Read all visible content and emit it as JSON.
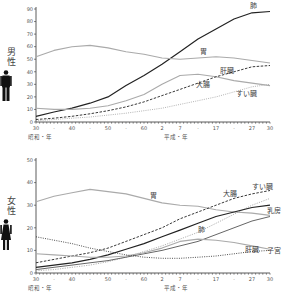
{
  "chart_data": [
    {
      "type": "line",
      "title": "男性",
      "panel": "male",
      "xlabel_left": "昭和・年",
      "xlabel_right": "平成・年",
      "x": [
        "S30",
        "S35",
        "S40",
        "S45",
        "S50",
        "S55",
        "S60",
        "H2",
        "H7",
        "H12",
        "H17",
        "H22",
        "H27",
        "H30"
      ],
      "x_tick_labels": [
        "30",
        "·",
        "40",
        "·",
        "50",
        "·",
        "60",
        "2",
        "7",
        "·",
        "17",
        "·",
        "27",
        "30"
      ],
      "ylim": [
        0,
        90
      ],
      "y_ticks": [
        0,
        10,
        20,
        30,
        40,
        50,
        60,
        70,
        80,
        90
      ],
      "grid": false,
      "legend_position": "inline labels",
      "series": [
        {
          "name": "肺",
          "style": "solid-dark",
          "values": [
            4.5,
            8,
            11,
            15,
            20,
            29,
            37,
            46,
            56,
            66,
            74,
            82,
            87,
            88
          ]
        },
        {
          "name": "胃",
          "style": "solid-light",
          "values": [
            52,
            57,
            60,
            61,
            59,
            56,
            54,
            51,
            50,
            51,
            52,
            51,
            49,
            47
          ]
        },
        {
          "name": "肝臓",
          "style": "solid-light",
          "values": [
            11,
            10,
            10,
            11,
            13,
            17,
            22,
            30,
            37,
            38,
            36,
            33,
            31,
            29
          ]
        },
        {
          "name": "大腸",
          "style": "dashed",
          "values": [
            2,
            3,
            4.5,
            6.5,
            9,
            12,
            16,
            21,
            26,
            31,
            36,
            40,
            44,
            45
          ]
        },
        {
          "name": "すい臓",
          "style": "dotted",
          "values": [
            1,
            2,
            3,
            4,
            5.5,
            7,
            9,
            11,
            14,
            17,
            20,
            24,
            28,
            30
          ]
        }
      ]
    },
    {
      "type": "line",
      "title": "女性",
      "panel": "female",
      "xlabel_left": "昭和・年",
      "xlabel_right": "平成・年",
      "x": [
        "S30",
        "S35",
        "S40",
        "S45",
        "S50",
        "S55",
        "S60",
        "H2",
        "H7",
        "H12",
        "H17",
        "H22",
        "H27",
        "H30"
      ],
      "x_tick_labels": [
        "30",
        "·",
        "40",
        "·",
        "50",
        "·",
        "60",
        "2",
        "7",
        "·",
        "17",
        "·",
        "27",
        "30"
      ],
      "ylim": [
        0,
        50
      ],
      "y_ticks": [
        0,
        10,
        20,
        30,
        40,
        50
      ],
      "grid": false,
      "legend_position": "inline labels",
      "series": [
        {
          "name": "胃",
          "style": "solid-light",
          "values": [
            31.5,
            34,
            35.5,
            37,
            36,
            35,
            33,
            31,
            30,
            29.5,
            28,
            27,
            26.5,
            25.5
          ]
        },
        {
          "name": "大腸",
          "style": "dashed",
          "values": [
            4.5,
            6,
            7.5,
            9,
            11,
            14,
            17,
            20,
            24,
            27,
            30,
            33,
            35,
            36.5
          ]
        },
        {
          "name": "すい臓",
          "style": "dotted-light",
          "values": [
            1,
            1.5,
            2.5,
            3.5,
            5,
            7,
            9.5,
            12,
            15,
            18,
            22,
            26,
            30,
            33
          ]
        },
        {
          "name": "肺",
          "style": "solid-dark",
          "values": [
            2.5,
            3.5,
            4.5,
            6,
            8,
            10.5,
            13,
            16,
            19,
            22,
            25,
            27,
            29,
            30
          ]
        },
        {
          "name": "乳房",
          "style": "solid-mid",
          "values": [
            1.5,
            2.5,
            3.5,
            4.5,
            5.5,
            7,
            8.5,
            10,
            12,
            14,
            17,
            20,
            23,
            25
          ]
        },
        {
          "name": "肝臓",
          "style": "solid-light",
          "values": [
            8.5,
            8,
            7.5,
            7,
            7,
            7.5,
            9,
            11,
            14,
            15,
            14.5,
            13.5,
            12,
            10.5
          ]
        },
        {
          "name": "子宮",
          "style": "dotted-dark",
          "values": [
            16,
            14.5,
            13,
            11,
            9.5,
            8,
            7,
            6.5,
            6.5,
            7,
            7.5,
            8.5,
            9.5,
            10
          ]
        }
      ]
    }
  ],
  "panels": {
    "male": {
      "sex_label": "男性",
      "icon": "male-figure-icon"
    },
    "female": {
      "sex_label": "女性",
      "icon": "female-figure-icon"
    }
  },
  "colors": {
    "dark_line": "#222222",
    "light_line": "#aaaaaa",
    "mid_line": "#666666",
    "axis": "#333333"
  }
}
